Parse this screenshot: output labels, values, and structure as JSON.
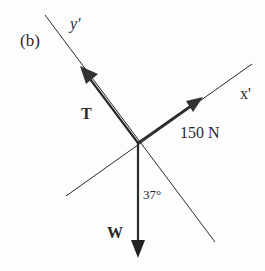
{
  "diagram": {
    "panel_label": "(b)",
    "axes": {
      "x_prime": "x'",
      "y_prime": "y'"
    },
    "forces": [
      {
        "name": "T",
        "label": "T",
        "direction": "along +y' axis"
      },
      {
        "name": "F",
        "label": "150 N",
        "direction": "along +x' axis"
      },
      {
        "name": "W",
        "label": "W",
        "direction": "vertically downward"
      }
    ],
    "angle": {
      "label": "37°",
      "between": "W and -y' axis"
    },
    "colors": {
      "line": "#2a2a2a",
      "background": "#fdfdfd"
    }
  }
}
